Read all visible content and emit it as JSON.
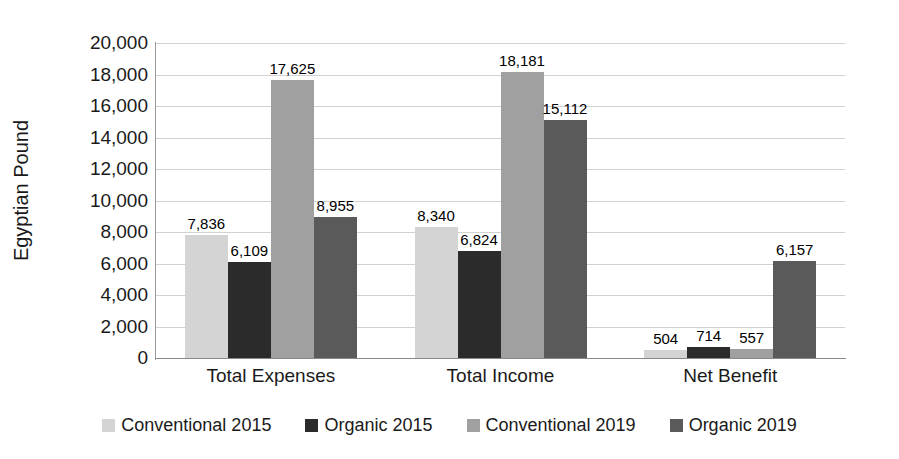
{
  "chart_data": {
    "type": "bar",
    "title": "",
    "xlabel": "",
    "ylabel": "Egyptian Pound",
    "categories": [
      "Total Expenses",
      "Total Income",
      "Net Benefit"
    ],
    "series": [
      {
        "name": "Conventional 2015",
        "color": "#d4d4d4",
        "values": [
          7836,
          8340,
          504
        ]
      },
      {
        "name": "Organic 2015",
        "color": "#2b2b2b",
        "values": [
          6109,
          6824,
          714
        ]
      },
      {
        "name": "Conventional 2019",
        "color": "#a0a0a0",
        "values": [
          17625,
          18181,
          557
        ]
      },
      {
        "name": "Organic 2019",
        "color": "#5a5a5a",
        "values": [
          8955,
          15112,
          6157
        ]
      }
    ],
    "value_labels": [
      [
        "7,836",
        "8,340",
        "504"
      ],
      [
        "6,109",
        "6,824",
        "714"
      ],
      [
        "17,625",
        "18,181",
        "557"
      ],
      [
        "8,955",
        "15,112",
        "6,157"
      ]
    ],
    "ylim": [
      0,
      20000
    ],
    "y_tick_values": [
      20000,
      18000,
      16000,
      14000,
      12000,
      10000,
      8000,
      6000,
      4000,
      2000,
      0
    ],
    "y_tick_labels": [
      "20,000",
      "18,000",
      "16,000",
      "14,000",
      "12,000",
      "10,000",
      "8,000",
      "6,000",
      "4,000",
      "2,000",
      "0"
    ],
    "grid": true,
    "legend_position": "bottom"
  },
  "axis": {
    "y_title": "Egyptian Pound"
  },
  "legend": {
    "items": [
      {
        "label": "Conventional 2015",
        "color": "#d4d4d4"
      },
      {
        "label": "Organic 2015",
        "color": "#2b2b2b"
      },
      {
        "label": "Conventional 2019",
        "color": "#a0a0a0"
      },
      {
        "label": "Organic 2019",
        "color": "#5a5a5a"
      }
    ]
  }
}
